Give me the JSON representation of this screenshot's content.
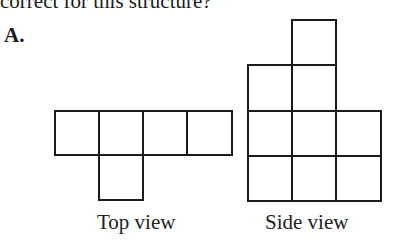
{
  "question": {
    "text_fragment": "correct for this structure?"
  },
  "option": {
    "label": "A."
  },
  "figures": {
    "top_view": {
      "caption": "Top view",
      "grid_description": "Row 1: 4 squares; Row 2: 1 square under column 2",
      "cells": [
        [
          0,
          0
        ],
        [
          1,
          0
        ],
        [
          2,
          0
        ],
        [
          3,
          0
        ],
        [
          1,
          1
        ]
      ]
    },
    "side_view": {
      "caption": "Side view",
      "grid_description": "Column heights from left: 3, 4, 2",
      "column_heights": [
        3,
        4,
        2
      ]
    }
  },
  "colors": {
    "line": "#1a1a1a",
    "background": "#ffffff"
  }
}
